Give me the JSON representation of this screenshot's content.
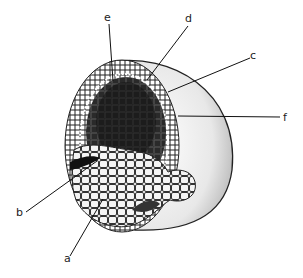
{
  "diagram": {
    "labels": [
      {
        "id": "a",
        "text": "a",
        "x": 67,
        "y": 261,
        "target": [
          103,
          199
        ]
      },
      {
        "id": "b",
        "text": "b",
        "x": 20,
        "y": 215,
        "target": [
          97,
          161
        ]
      },
      {
        "id": "c",
        "text": "c",
        "x": 252,
        "y": 59,
        "target": [
          168,
          92
        ]
      },
      {
        "id": "d",
        "text": "d",
        "x": 189,
        "y": 22,
        "target": [
          147,
          80
        ]
      },
      {
        "id": "e",
        "text": "e",
        "x": 107,
        "y": 21,
        "target": [
          113,
          81
        ]
      },
      {
        "id": "f",
        "text": "f",
        "x": 285,
        "y": 120,
        "target": [
          178,
          116
        ]
      }
    ]
  }
}
